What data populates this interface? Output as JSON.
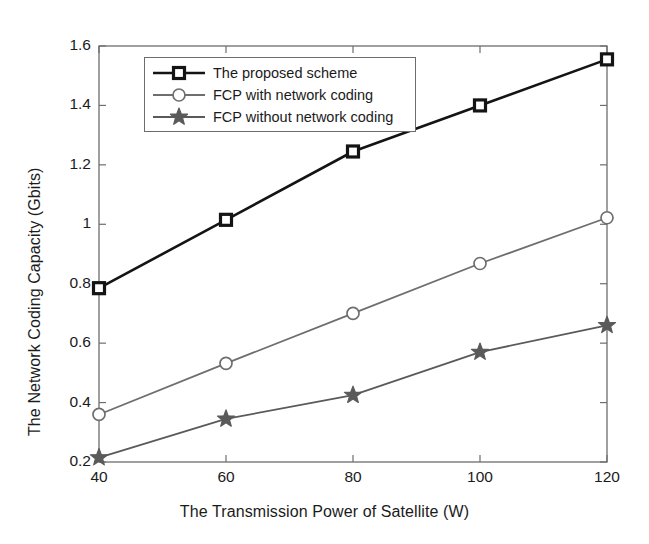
{
  "chart_data": {
    "type": "line",
    "title": "",
    "xlabel": "The Transmission Power of Satellite (W)",
    "ylabel": "The Network Coding Capacity (Gbits)",
    "x": [
      40,
      60,
      80,
      100,
      120
    ],
    "xlim": [
      40,
      120
    ],
    "ylim": [
      0.2,
      1.6
    ],
    "xticks": [
      40,
      60,
      80,
      100,
      120
    ],
    "yticks": [
      0.2,
      0.4,
      0.6,
      0.8,
      1,
      1.2,
      1.4,
      1.6
    ],
    "xtick_labels": [
      "40",
      "60",
      "80",
      "100",
      "120"
    ],
    "ytick_labels": [
      "0.2",
      "0.4",
      "0.6",
      "0.8",
      "1",
      "1.2",
      "1.4",
      "1.6"
    ],
    "grid": false,
    "legend_position": "upper left",
    "series": [
      {
        "name": "The proposed scheme",
        "marker": "square",
        "color": "#141414",
        "line_width": 2.6,
        "values": [
          0.785,
          1.015,
          1.245,
          1.4,
          1.555
        ]
      },
      {
        "name": "FCP with network coding",
        "marker": "circle",
        "color": "#6e6e6e",
        "line_width": 1.8,
        "values": [
          0.36,
          0.532,
          0.7,
          0.868,
          1.022
        ]
      },
      {
        "name": "FCP without network coding",
        "marker": "star",
        "color": "#5a5a5a",
        "line_width": 1.8,
        "values": [
          0.215,
          0.345,
          0.425,
          0.57,
          0.66
        ]
      }
    ]
  },
  "legend": {
    "items": [
      {
        "label": "The proposed scheme"
      },
      {
        "label": "FCP with network coding"
      },
      {
        "label": "FCP without network coding"
      }
    ]
  },
  "axes": {
    "frame_color": "#6d6d6d",
    "text_color": "#1b1b1b"
  }
}
